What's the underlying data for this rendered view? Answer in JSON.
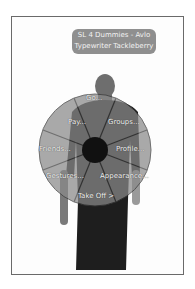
{
  "nametag": {
    "line1": "SL 4 Dummies - Avlo",
    "line2": "Typewriter Tackleberry"
  },
  "pie_menu": {
    "items": [
      {
        "label": "Go...",
        "x": 86,
        "y": 94
      },
      {
        "label": "Groups...",
        "x": 108,
        "y": 118
      },
      {
        "label": "Profile...",
        "x": 116,
        "y": 145
      },
      {
        "label": "Appearance...",
        "x": 100,
        "y": 172
      },
      {
        "label": "Take Off >",
        "x": 78,
        "y": 192
      },
      {
        "label": "Gestures...",
        "x": 46,
        "y": 172
      },
      {
        "label": "Friends...",
        "x": 39,
        "y": 145
      },
      {
        "label": "Pay...",
        "x": 68,
        "y": 118
      }
    ]
  },
  "colors": {
    "pie_fill": "#8a8a8a",
    "pie_edge": "#3a3a3a",
    "center": "#111111",
    "avatar": "#1e1e1e",
    "nametag_bg": "#8f8f8f"
  }
}
